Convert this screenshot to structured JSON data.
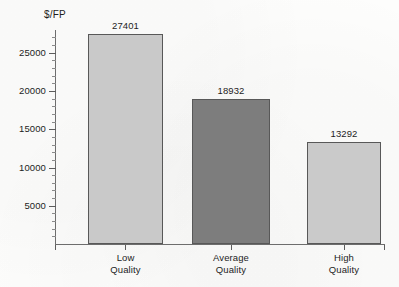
{
  "chart_data": {
    "type": "bar",
    "title": "",
    "subtitle": "",
    "xlabel": "",
    "ylabel": "$/FP",
    "categories": [
      "Low Quality",
      "Average Quality",
      "High Quality"
    ],
    "category_lines": [
      [
        "Low",
        "Quality"
      ],
      [
        "Average",
        "Quality"
      ],
      [
        "High",
        "Quality"
      ]
    ],
    "values": [
      27401,
      18932,
      13292
    ],
    "value_labels": [
      "27401",
      "18932",
      "13292"
    ],
    "bar_colors": [
      "#c9c9c9",
      "#7d7d7d",
      "#cacaca"
    ],
    "bar_border_color": "#585858",
    "ylim": [
      0,
      28000
    ],
    "y_tick_values": [
      5000,
      10000,
      15000,
      20000,
      25000
    ],
    "y_tick_labels": [
      "5000",
      "10000",
      "15000",
      "20000",
      "25000"
    ],
    "y_minor_tick_step": 1000,
    "grid": false,
    "legend": false,
    "legend_position": "none",
    "axis_color": "#6d6d6d",
    "background_color": "#fdfdfc",
    "text_color": "#1d1d1d"
  }
}
